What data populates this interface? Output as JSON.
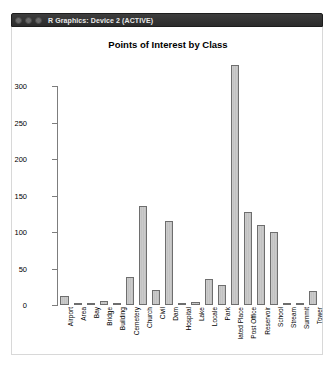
{
  "window": {
    "title": "R Graphics: Device 2 (ACTIVE)",
    "controls": [
      {
        "name": "close-button",
        "color": "#6a6a6a"
      },
      {
        "name": "minimize-button",
        "color": "#6a6a6a"
      },
      {
        "name": "maximize-button",
        "color": "#6a6a6a"
      }
    ]
  },
  "colors": {
    "bar_fill": "#c9c9c9",
    "bar_border": "#6e6e6e",
    "axis": "#7d7d7d",
    "titlebar": "#2b2b2b",
    "canvas": "#ffffff"
  },
  "chart_data": {
    "type": "bar",
    "title": "Points of Interest by Class",
    "xlabel": "",
    "ylabel": "",
    "ylim": [
      0,
      330
    ],
    "yticks": [
      0,
      50,
      100,
      150,
      200,
      250,
      300
    ],
    "grid": false,
    "legend": null,
    "categories": [
      "Airport",
      "Area",
      "Bay",
      "Bridge",
      "Building",
      "Cemetery",
      "Church",
      "Civil",
      "Dam",
      "Hospital",
      "Lake",
      "Locale",
      "Park",
      "lated Place",
      "Post Office",
      "Reservoir",
      "School",
      "Stream",
      "Summit",
      "Tower"
    ],
    "values": [
      12,
      1,
      2,
      5,
      1,
      39,
      135,
      21,
      115,
      3,
      4,
      36,
      27,
      329,
      128,
      110,
      100,
      2,
      1,
      19
    ]
  }
}
